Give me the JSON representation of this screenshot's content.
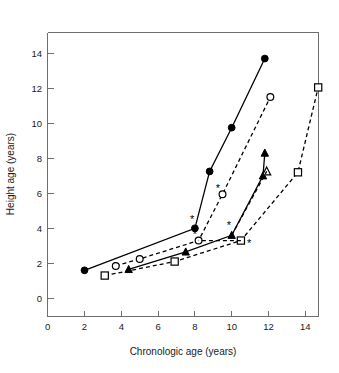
{
  "chart_data": {
    "type": "line",
    "title": "",
    "xlabel": "Chronologic age (years)",
    "ylabel": "Height age (years)",
    "xlim": [
      0,
      15
    ],
    "ylim": [
      0,
      15
    ],
    "xticks": [
      0,
      2,
      4,
      6,
      8,
      10,
      12,
      14
    ],
    "xtick_labels": [
      "0",
      "2",
      "4",
      "6",
      "8",
      "10",
      "12",
      "14"
    ],
    "yticks": [
      0,
      2,
      4,
      6,
      8,
      10,
      12,
      14
    ],
    "ytick_labels": [
      "0",
      "2",
      "4",
      "6",
      "8",
      "10",
      "12",
      "14"
    ],
    "grid": false,
    "legend": "none",
    "series": [
      {
        "name": "Patient 1",
        "marker": "filled-circle",
        "line_style": "solid",
        "x": [
          2.0,
          8.0,
          8.8,
          10.0,
          11.8
        ],
        "y": [
          1.6,
          4.0,
          7.25,
          9.75,
          13.7
        ]
      },
      {
        "name": "Patient 2",
        "marker": "open-circle",
        "line_style": "dashed",
        "x": [
          3.7,
          5.0,
          8.2,
          9.5,
          12.1
        ],
        "y": [
          1.85,
          2.25,
          3.3,
          5.95,
          11.5
        ]
      },
      {
        "name": "Patient 3",
        "marker": "filled-triangle",
        "line_style": "solid",
        "x": [
          4.4,
          7.5,
          10.0,
          11.7,
          11.8
        ],
        "y": [
          1.65,
          2.65,
          3.6,
          7.0,
          8.3
        ]
      },
      {
        "name": "Patient 4",
        "marker": "open-square",
        "line_style": "dashed",
        "x": [
          3.1,
          6.9,
          10.5,
          13.6,
          14.7
        ],
        "y": [
          1.3,
          2.1,
          3.3,
          7.2,
          12.05
        ]
      },
      {
        "name": "Patient 5",
        "marker": "open-triangle",
        "line_style": "dashed",
        "x": [
          11.9
        ],
        "y": [
          7.25
        ]
      }
    ],
    "annotations": [
      {
        "symbol": "*",
        "x": 7.85,
        "y": 4.3,
        "note": "treatment-start-marker"
      },
      {
        "symbol": "*",
        "x": 8.0,
        "y": 3.45,
        "note": "treatment-start-marker"
      },
      {
        "symbol": "*",
        "x": 9.25,
        "y": 6.05,
        "note": "treatment-start-marker"
      },
      {
        "symbol": "*",
        "x": 9.85,
        "y": 3.95,
        "note": "treatment-start-marker"
      },
      {
        "symbol": "*",
        "x": 10.95,
        "y": 2.95,
        "note": "treatment-start-marker"
      }
    ]
  },
  "figure": {
    "background_color": "#ffffff",
    "axis_color": "#6e6e6e",
    "data_color": "#000000"
  }
}
